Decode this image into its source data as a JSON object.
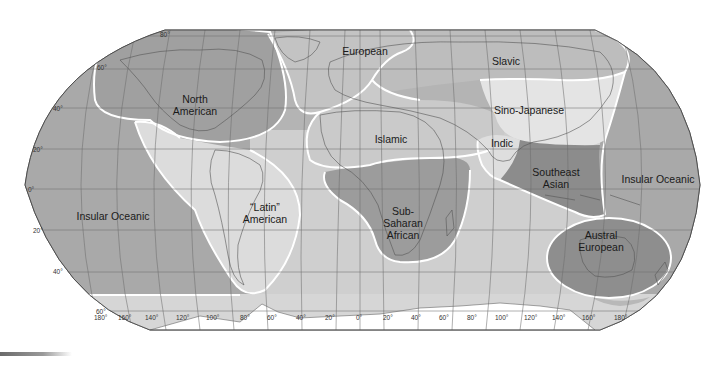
{
  "map": {
    "title": "Culture realms of the world",
    "projection": "Robinson-like (pseudocylindrical)",
    "colors": {
      "background": "#ffffff",
      "ocean_base": "#b4b4b4",
      "insular_oceanic": "#a9a9a9",
      "north_american": "#a0a0a0",
      "european": "#c3c3c3",
      "slavic": "#bdbdbd",
      "sino_japanese": "#e4e4e4",
      "islamic": "#cacaca",
      "indic": "#dedede",
      "latin_american": "#dcdcdc",
      "sub_saharan_african": "#9c9c9c",
      "southeast_asian": "#8c8c8c",
      "austral_european": "#8e8e8e",
      "antarctic_band": "#d6d6d6",
      "region_border": "#ffffff",
      "graticule": "#6e6e6e"
    },
    "regions": [
      {
        "id": "north-american",
        "label_lines": [
          "North",
          "American"
        ]
      },
      {
        "id": "european",
        "label_lines": [
          "European"
        ]
      },
      {
        "id": "slavic",
        "label_lines": [
          "Slavic"
        ]
      },
      {
        "id": "sino-japanese",
        "label_lines": [
          "Sino-Japanese"
        ]
      },
      {
        "id": "islamic",
        "label_lines": [
          "Islamic"
        ]
      },
      {
        "id": "indic",
        "label_lines": [
          "Indic"
        ]
      },
      {
        "id": "southeast-asian",
        "label_lines": [
          "Southeast",
          "Asian"
        ]
      },
      {
        "id": "insular-oceanic-east",
        "label_lines": [
          "Insular Oceanic"
        ]
      },
      {
        "id": "insular-oceanic-west",
        "label_lines": [
          "Insular Oceanic"
        ]
      },
      {
        "id": "latin-american",
        "label_lines": [
          "“Latin”",
          "American"
        ]
      },
      {
        "id": "sub-saharan-african",
        "label_lines": [
          "Sub-",
          "Saharan",
          "African"
        ]
      },
      {
        "id": "austral-european",
        "label_lines": [
          "Austral",
          "European"
        ]
      }
    ],
    "latitude_labels": [
      "80°",
      "60°",
      "40°",
      "20°",
      "0°",
      "20°",
      "40°",
      "60°"
    ],
    "longitude_labels": [
      "180°",
      "160°",
      "140°",
      "120°",
      "100°",
      "80°",
      "60°",
      "40°",
      "20°",
      "0°",
      "20°",
      "40°",
      "60°",
      "80°",
      "100°",
      "120°",
      "140°",
      "160°",
      "180°"
    ]
  }
}
